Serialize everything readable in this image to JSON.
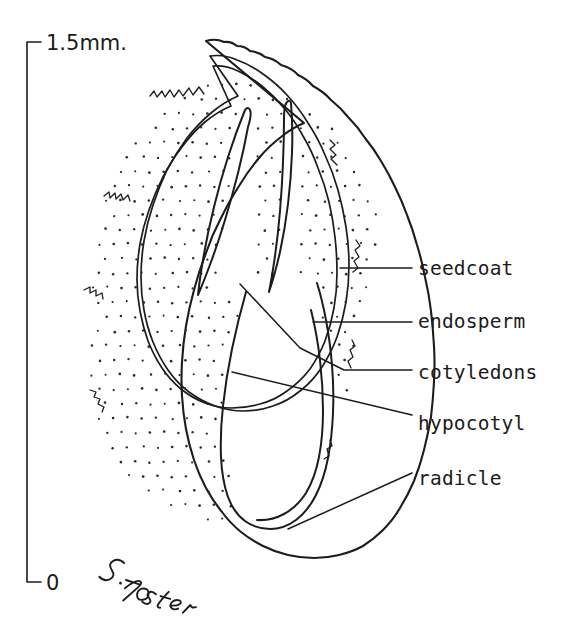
{
  "figure": {
    "medium": "pen-and-ink botanical illustration",
    "background_color": "#ffffff",
    "ink_color": "#1c1c1c",
    "signature": "S.Foster"
  },
  "scale": {
    "top_label": "1.5mm.",
    "bottom_label": "0",
    "axis_top_y": 42,
    "axis_bottom_y": 582
  },
  "labels": [
    {
      "id": "seedcoat",
      "text": "seedcoat",
      "x": 418,
      "y": 275,
      "leader": "M 340 268 L 412 268",
      "target": "outer seed coat layer"
    },
    {
      "id": "endosperm",
      "text": "endosperm",
      "x": 418,
      "y": 328,
      "leader": "M 313 322 L 412 322",
      "target": "stippled nutritive tissue"
    },
    {
      "id": "cotyledons",
      "text": "cotyledons",
      "x": 418,
      "y": 379,
      "leader": "M 240 284 L 300 348 L 344 370 L 412 370",
      "target": "paired embryonic leaves"
    },
    {
      "id": "hypocotyl",
      "text": "hypocotyl",
      "x": 418,
      "y": 430,
      "leader": "M 232 372 L 412 415",
      "target": "embryonic stem axis"
    },
    {
      "id": "radicle",
      "text": "radicle",
      "x": 418,
      "y": 485,
      "leader": "M 288 529 L 412 473",
      "target": "embryonic root tip"
    }
  ],
  "chart_data": {
    "type": "table",
    "categories": [
      "seedcoat",
      "endosperm",
      "cotyledons",
      "hypocotyl",
      "radicle"
    ],
    "scale_range": [
      "0",
      "1.5mm."
    ]
  }
}
